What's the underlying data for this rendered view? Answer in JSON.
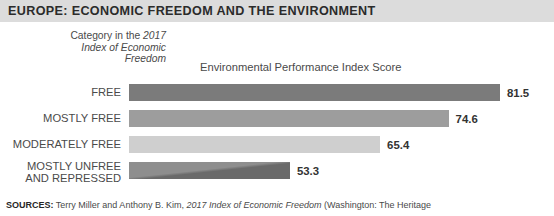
{
  "banner": {
    "title": "EUROPE: ECONOMIC FREEDOM AND THE ENVIRONMENT",
    "background_color": "#dcdcdc",
    "text_color": "#2b2b2b"
  },
  "caption": {
    "line1_plain": "Category in the ",
    "line1_italic": "2017",
    "line2_italic": "Index of Economic",
    "line3_italic": "Freedom"
  },
  "sources": {
    "label": "SOURCES:",
    "text_before_italic": " Terry Miller and Anthony B. Kim, ",
    "italic_title": "2017 Index of Economic Freedom",
    "text_after_italic": " (Washington: The Heritage"
  },
  "chart_data": {
    "type": "bar",
    "orientation": "horizontal",
    "title": "EUROPE: ECONOMIC FREEDOM AND THE ENVIRONMENT",
    "subtitle": "Category in the 2017 Index of Economic Freedom",
    "xlabel": "Environmental Performance Index Score",
    "ylabel": "Category in the 2017 Index of Economic Freedom",
    "grid": false,
    "legend": false,
    "axis_min": 31.7,
    "axis_max": 81.5,
    "value_format": "one-decimal",
    "categories": [
      "FREE",
      "MOSTLY FREE",
      "MODERATELY FREE",
      "MOSTLY UNFREE\nAND REPRESSED"
    ],
    "values": [
      81.5,
      74.6,
      65.4,
      53.3
    ],
    "value_labels": [
      "81.5",
      "74.6",
      "65.4",
      "53.3"
    ],
    "bar_colors": [
      "#7b7b7b",
      "#9d9d9d",
      "#cfcfcf",
      "#6a6a6a"
    ],
    "series": [
      {
        "name": "Environmental Performance Index Score",
        "values": [
          81.5,
          74.6,
          65.4,
          53.3
        ]
      }
    ]
  }
}
